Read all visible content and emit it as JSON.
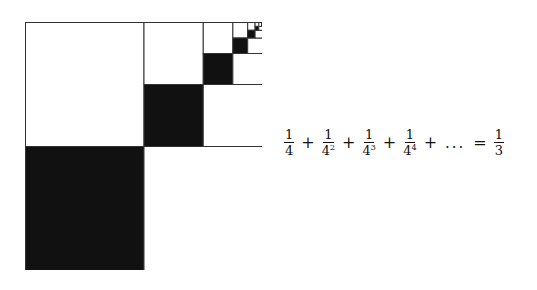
{
  "figure": {
    "fill_color": "#111111",
    "stroke_color": "#333333",
    "background": "#ffffff",
    "levels": 6
  },
  "equation": {
    "terms": [
      {
        "num": "1",
        "base": "4",
        "exp": ""
      },
      {
        "num": "1",
        "base": "4",
        "exp": "2"
      },
      {
        "num": "1",
        "base": "4",
        "exp": "3"
      },
      {
        "num": "1",
        "base": "4",
        "exp": "4"
      }
    ],
    "plus": "+",
    "ellipsis": "...",
    "equals": "=",
    "result": {
      "num": "1",
      "den": "3"
    }
  }
}
